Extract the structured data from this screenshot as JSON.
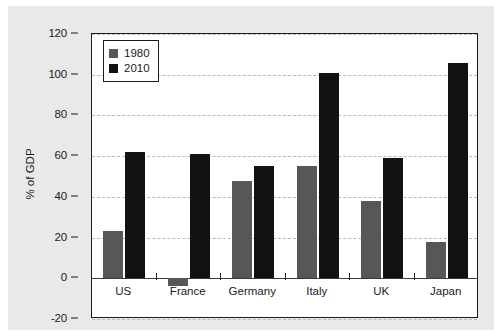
{
  "chart_data": {
    "type": "bar",
    "title": "",
    "xlabel": "",
    "ylabel": "% of GDP",
    "categories": [
      "US",
      "France",
      "Germany",
      "Italy",
      "UK",
      "Japan"
    ],
    "series": [
      {
        "name": "1980",
        "color": "#575757",
        "values": [
          23,
          -4,
          48,
          55,
          38,
          18
        ]
      },
      {
        "name": "2010",
        "color": "#121212",
        "values": [
          62,
          61,
          55,
          101,
          59,
          106
        ]
      }
    ],
    "ylim": [
      -20,
      120
    ],
    "ytick_values": [
      120,
      100,
      80,
      60,
      40,
      20,
      0,
      -20
    ],
    "ytick_labels": [
      "120",
      "100",
      "80",
      "60",
      "40",
      "20",
      "0",
      "-20"
    ],
    "grid": true,
    "grid_axis": "y",
    "grid_style": "dashed",
    "grid_color": "#b9b9b9",
    "legend_position": "upper-left",
    "legend_entries": [
      "1980",
      "2010"
    ],
    "figure_background": "#e9e9e9",
    "plot_background": "#ffffff",
    "axis_color": "#1b1b1b"
  }
}
